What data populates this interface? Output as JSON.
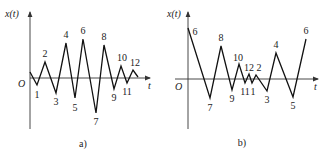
{
  "panels": [
    {
      "id": "a",
      "caption": "a)",
      "y_label": "x(t)",
      "x_label": "t",
      "origin_label": "O",
      "axis": {
        "x": 30,
        "top": 12,
        "bottom": 129,
        "t_y": 78,
        "t_left": 30,
        "t_right": 150
      },
      "path_points": [
        [
          30,
          72
        ],
        [
          37,
          85
        ],
        [
          45,
          62
        ],
        [
          56,
          93
        ],
        [
          66,
          43
        ],
        [
          75,
          98
        ],
        [
          83,
          39
        ],
        [
          96,
          113
        ],
        [
          104,
          45
        ],
        [
          114,
          89
        ],
        [
          121,
          66
        ],
        [
          127,
          83
        ],
        [
          133,
          70
        ],
        [
          138,
          77
        ]
      ],
      "point_labels": [
        {
          "text": "1",
          "x": 37,
          "y": 98
        },
        {
          "text": "2",
          "x": 45,
          "y": 57
        },
        {
          "text": "3",
          "x": 56,
          "y": 105
        },
        {
          "text": "4",
          "x": 66,
          "y": 38
        },
        {
          "text": "5",
          "x": 75,
          "y": 111
        },
        {
          "text": "6",
          "x": 83,
          "y": 34
        },
        {
          "text": "7",
          "x": 96,
          "y": 125
        },
        {
          "text": "8",
          "x": 104,
          "y": 40
        },
        {
          "text": "9",
          "x": 114,
          "y": 101
        },
        {
          "text": "10",
          "x": 122,
          "y": 61
        },
        {
          "text": "11",
          "x": 127,
          "y": 95
        },
        {
          "text": "12",
          "x": 135,
          "y": 66
        }
      ],
      "caption_pos": {
        "x": 83,
        "y": 147
      }
    },
    {
      "id": "b",
      "caption": "b)",
      "y_label": "x(t)",
      "x_label": "t",
      "origin_label": "O",
      "axis": {
        "x": 188,
        "top": 12,
        "bottom": 129,
        "t_y": 79,
        "t_left": 175,
        "t_right": 318
      },
      "path_points": [
        [
          188,
          28
        ],
        [
          210,
          98
        ],
        [
          221,
          46
        ],
        [
          232,
          90
        ],
        [
          239,
          64
        ],
        [
          245,
          83
        ],
        [
          249,
          74
        ],
        [
          252,
          83
        ],
        [
          256,
          75
        ],
        [
          267,
          91
        ],
        [
          276,
          53
        ],
        [
          293,
          97
        ],
        [
          306,
          39
        ]
      ],
      "point_labels": [
        {
          "text": "6",
          "x": 195,
          "y": 35
        },
        {
          "text": "7",
          "x": 210,
          "y": 111
        },
        {
          "text": "8",
          "x": 221,
          "y": 41
        },
        {
          "text": "9",
          "x": 232,
          "y": 102
        },
        {
          "text": "10",
          "x": 238,
          "y": 61
        },
        {
          "text": "11",
          "x": 245,
          "y": 95
        },
        {
          "text": "12",
          "x": 249,
          "y": 71
        },
        {
          "text": "1",
          "x": 253,
          "y": 95
        },
        {
          "text": "2",
          "x": 259,
          "y": 71
        },
        {
          "text": "3",
          "x": 267,
          "y": 103
        },
        {
          "text": "4",
          "x": 276,
          "y": 48
        },
        {
          "text": "5",
          "x": 293,
          "y": 109
        },
        {
          "text": "6",
          "x": 306,
          "y": 34
        }
      ],
      "caption_pos": {
        "x": 242,
        "y": 146
      }
    }
  ]
}
